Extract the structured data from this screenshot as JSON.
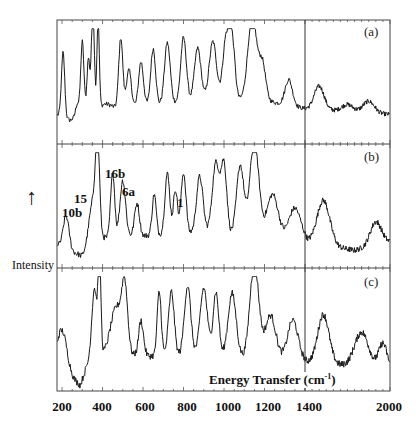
{
  "chart_data": {
    "type": "line",
    "title": "",
    "xlabel": "Energy Transfer (cm-1)",
    "ylabel": "Intensity",
    "xlim": [
      175,
      2000
    ],
    "x_axis_break": 1400,
    "x_ticks": [
      200,
      400,
      600,
      800,
      1000,
      1200,
      1400,
      2000
    ],
    "grid": false,
    "legend": null,
    "panels": [
      {
        "label": "(a)",
        "baseline": 0.25,
        "noise": 0.02,
        "peaks": [
          {
            "x": 205,
            "h": 0.55,
            "w": 8
          },
          {
            "x": 275,
            "h": 0.1,
            "w": 8
          },
          {
            "x": 300,
            "h": 0.6,
            "w": 8
          },
          {
            "x": 330,
            "h": 0.45,
            "w": 7
          },
          {
            "x": 352,
            "h": 0.9,
            "w": 7
          },
          {
            "x": 378,
            "h": 0.75,
            "w": 6
          },
          {
            "x": 415,
            "h": 0.05,
            "w": 30
          },
          {
            "x": 490,
            "h": 0.6,
            "w": 10
          },
          {
            "x": 530,
            "h": 0.32,
            "w": 12
          },
          {
            "x": 590,
            "h": 0.38,
            "w": 12
          },
          {
            "x": 650,
            "h": 0.48,
            "w": 12
          },
          {
            "x": 720,
            "h": 0.52,
            "w": 14
          },
          {
            "x": 800,
            "h": 0.55,
            "w": 14
          },
          {
            "x": 870,
            "h": 0.45,
            "w": 16
          },
          {
            "x": 945,
            "h": 0.5,
            "w": 18
          },
          {
            "x": 1010,
            "h": 0.52,
            "w": 16
          },
          {
            "x": 1040,
            "h": 0.5,
            "w": 14
          },
          {
            "x": 1140,
            "h": 0.72,
            "w": 22
          },
          {
            "x": 1190,
            "h": 0.3,
            "w": 16
          },
          {
            "x": 1320,
            "h": 0.22,
            "w": 18
          },
          {
            "x": 1500,
            "h": 0.2,
            "w": 35
          },
          {
            "x": 1700,
            "h": 0.06,
            "w": 40
          },
          {
            "x": 1850,
            "h": 0.1,
            "w": 40
          }
        ],
        "trend": [
          [
            175,
            0.0
          ],
          [
            240,
            -0.05
          ],
          [
            300,
            0.02
          ],
          [
            900,
            0.12
          ],
          [
            1200,
            0.12
          ],
          [
            1400,
            0.05
          ],
          [
            2000,
            0.0
          ]
        ]
      },
      {
        "label": "(b)",
        "baseline": 0.2,
        "noise": 0.025,
        "peaks": [
          {
            "x": 220,
            "h": 0.28,
            "w": 14
          },
          {
            "x": 375,
            "h": 0.85,
            "w": 10
          },
          {
            "x": 350,
            "h": 0.3,
            "w": 18
          },
          {
            "x": 450,
            "h": 0.55,
            "w": 10
          },
          {
            "x": 500,
            "h": 0.48,
            "w": 14
          },
          {
            "x": 570,
            "h": 0.28,
            "w": 12
          },
          {
            "x": 655,
            "h": 0.35,
            "w": 10
          },
          {
            "x": 720,
            "h": 0.52,
            "w": 12
          },
          {
            "x": 760,
            "h": 0.38,
            "w": 10
          },
          {
            "x": 800,
            "h": 0.52,
            "w": 12
          },
          {
            "x": 880,
            "h": 0.48,
            "w": 16
          },
          {
            "x": 960,
            "h": 0.6,
            "w": 18
          },
          {
            "x": 1000,
            "h": 0.58,
            "w": 14
          },
          {
            "x": 1080,
            "h": 0.6,
            "w": 18
          },
          {
            "x": 1150,
            "h": 0.82,
            "w": 22
          },
          {
            "x": 1240,
            "h": 0.38,
            "w": 28
          },
          {
            "x": 1350,
            "h": 0.28,
            "w": 30
          },
          {
            "x": 1530,
            "h": 0.38,
            "w": 45
          },
          {
            "x": 1900,
            "h": 0.2,
            "w": 40
          }
        ],
        "trend": [
          [
            175,
            0.0
          ],
          [
            300,
            -0.1
          ],
          [
            350,
            0.05
          ],
          [
            900,
            0.1
          ],
          [
            1400,
            0.02
          ],
          [
            1750,
            -0.05
          ],
          [
            2000,
            0.02
          ]
        ]
      },
      {
        "label": "(c)",
        "baseline": 0.2,
        "noise": 0.03,
        "peaks": [
          {
            "x": 200,
            "h": 0.35,
            "w": 25
          },
          {
            "x": 360,
            "h": 0.58,
            "w": 12
          },
          {
            "x": 385,
            "h": 0.85,
            "w": 7
          },
          {
            "x": 470,
            "h": 0.42,
            "w": 30
          },
          {
            "x": 510,
            "h": 0.5,
            "w": 14
          },
          {
            "x": 590,
            "h": 0.3,
            "w": 12
          },
          {
            "x": 680,
            "h": 0.55,
            "w": 10
          },
          {
            "x": 740,
            "h": 0.55,
            "w": 14
          },
          {
            "x": 820,
            "h": 0.6,
            "w": 16
          },
          {
            "x": 900,
            "h": 0.58,
            "w": 18
          },
          {
            "x": 960,
            "h": 0.55,
            "w": 14
          },
          {
            "x": 1040,
            "h": 0.55,
            "w": 20
          },
          {
            "x": 1150,
            "h": 0.82,
            "w": 22
          },
          {
            "x": 1230,
            "h": 0.38,
            "w": 26
          },
          {
            "x": 1340,
            "h": 0.35,
            "w": 26
          },
          {
            "x": 1530,
            "h": 0.42,
            "w": 40
          },
          {
            "x": 1800,
            "h": 0.3,
            "w": 50
          },
          {
            "x": 1950,
            "h": 0.22,
            "w": 30
          }
        ],
        "trend": [
          [
            175,
            0.0
          ],
          [
            290,
            -0.15
          ],
          [
            340,
            0.1
          ],
          [
            900,
            0.1
          ],
          [
            1400,
            0.05
          ],
          [
            2000,
            -0.02
          ]
        ]
      }
    ],
    "annotations": [
      {
        "text": "10b",
        "panel": "(b)",
        "x_cm": 220
      },
      {
        "text": "15",
        "panel": "(b)",
        "x_cm": 290
      },
      {
        "text": "16b",
        "panel": "(b)",
        "x_cm": 450
      },
      {
        "text": "6a",
        "panel": "(b)",
        "x_cm": 510
      },
      {
        "text": "1",
        "panel": "(b)",
        "x_cm": 770
      }
    ]
  },
  "labels": {
    "panel_a": "(a)",
    "panel_b": "(b)",
    "panel_c": "(c)",
    "peak_10b": "10b",
    "peak_15": "15",
    "peak_16b": "16b",
    "peak_6a": "6a",
    "peak_1": "1",
    "xlabel_main": "Energy Transfer (cm",
    "xlabel_sup": "-1",
    "xlabel_end": ")",
    "ylabel": "Intensity",
    "yarrow": "↑",
    "ticks": [
      "200",
      "400",
      "600",
      "800",
      "1000",
      "1200",
      "1400",
      "2000"
    ]
  }
}
